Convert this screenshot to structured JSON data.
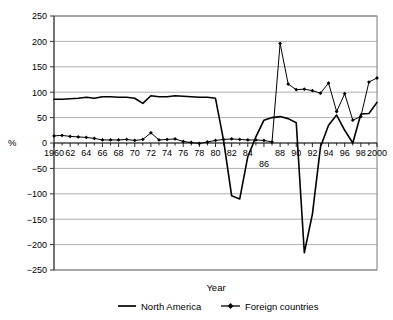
{
  "chart_data": {
    "type": "line",
    "title": "",
    "xlabel": "Year",
    "ylabel": "%",
    "ylim": [
      -250,
      250
    ],
    "ytick_step": 50,
    "yticks": [
      250,
      200,
      150,
      100,
      50,
      0,
      -50,
      -100,
      -150,
      -200,
      -250
    ],
    "ytick_labels": [
      "250",
      "200",
      "150",
      "100",
      "50",
      "0",
      "−50",
      "−100",
      "−150",
      "−200",
      "−250"
    ],
    "grid": true,
    "grid_axis": "y",
    "legend_position": "bottom",
    "x": [
      1960,
      1961,
      1962,
      1963,
      1964,
      1965,
      1966,
      1967,
      1968,
      1969,
      1970,
      1971,
      1972,
      1973,
      1974,
      1975,
      1976,
      1977,
      1978,
      1979,
      1980,
      1981,
      1982,
      1983,
      1984,
      1985,
      1986,
      1987,
      1988,
      1989,
      1990,
      1991,
      1992,
      1993,
      1994,
      1995,
      1996,
      1997,
      1998,
      1999,
      2000
    ],
    "xtick_labels": [
      "1960",
      "62",
      "64",
      "66",
      "68",
      "70",
      "72",
      "74",
      "76",
      "78",
      "80",
      "82",
      "84",
      "86",
      "88",
      "90",
      "92",
      "94",
      "96",
      "98",
      "2000"
    ],
    "xtick_values": [
      1960,
      1962,
      1964,
      1966,
      1968,
      1970,
      1972,
      1974,
      1976,
      1978,
      1980,
      1982,
      1984,
      1986,
      1988,
      1990,
      1992,
      1994,
      1996,
      1998,
      2000
    ],
    "series": [
      {
        "name": "North America",
        "marker": "none",
        "color": "#000000",
        "values": [
          86,
          86,
          87,
          88,
          90,
          88,
          91,
          91,
          90,
          90,
          88,
          78,
          93,
          91,
          91,
          93,
          92,
          91,
          90,
          90,
          88,
          0,
          -104,
          -110,
          -27,
          12,
          45,
          50,
          52,
          48,
          40,
          40,
          33,
          20,
          1,
          55,
          58,
          60,
          57,
          58,
          80
        ],
        "values_note": "approximate reading from plot"
      },
      {
        "name": "Foreign countries",
        "marker": "diamond",
        "color": "#000000",
        "values": [
          14,
          15,
          13,
          12,
          11,
          9,
          6,
          6,
          6,
          7,
          5,
          7,
          20,
          6,
          7,
          8,
          3,
          1,
          -1,
          2,
          5,
          7,
          8,
          7,
          6,
          6,
          5,
          2,
          196,
          116,
          105,
          106,
          103,
          98,
          118,
          62,
          97,
          45,
          52,
          120,
          128
        ],
        "values_note": "approximate reading from plot"
      }
    ],
    "na_points": [
      [
        1960,
        86
      ],
      [
        1961,
        86
      ],
      [
        1962,
        87
      ],
      [
        1963,
        88
      ],
      [
        1964,
        90
      ],
      [
        1965,
        88
      ],
      [
        1966,
        91
      ],
      [
        1967,
        91
      ],
      [
        1968,
        90
      ],
      [
        1969,
        90
      ],
      [
        1970,
        88
      ],
      [
        1971,
        78
      ],
      [
        1972,
        93
      ],
      [
        1973,
        91
      ],
      [
        1974,
        91
      ],
      [
        1975,
        93
      ],
      [
        1976,
        92
      ],
      [
        1977,
        91
      ],
      [
        1978,
        90
      ],
      [
        1979,
        90
      ],
      [
        1980,
        88
      ],
      [
        1981,
        5
      ],
      [
        1982,
        -104
      ],
      [
        1983,
        -110
      ],
      [
        1984,
        -27
      ],
      [
        1985,
        12
      ],
      [
        1986,
        45
      ],
      [
        1987,
        50
      ],
      [
        1988,
        52
      ],
      [
        1989,
        48
      ],
      [
        1990,
        40
      ],
      [
        1991,
        -216
      ],
      [
        1992,
        -140
      ],
      [
        1993,
        -8
      ],
      [
        1994,
        35
      ],
      [
        1995,
        55
      ],
      [
        1996,
        25
      ],
      [
        1997,
        0
      ],
      [
        1998,
        57
      ],
      [
        1999,
        58
      ],
      [
        2000,
        80
      ]
    ],
    "fc_points": [
      [
        1960,
        14
      ],
      [
        1961,
        15
      ],
      [
        1962,
        13
      ],
      [
        1963,
        12
      ],
      [
        1964,
        11
      ],
      [
        1965,
        9
      ],
      [
        1966,
        6
      ],
      [
        1967,
        6
      ],
      [
        1968,
        6
      ],
      [
        1969,
        7
      ],
      [
        1970,
        5
      ],
      [
        1971,
        7
      ],
      [
        1972,
        20
      ],
      [
        1973,
        6
      ],
      [
        1974,
        7
      ],
      [
        1975,
        8
      ],
      [
        1976,
        3
      ],
      [
        1977,
        1
      ],
      [
        1978,
        -1
      ],
      [
        1979,
        2
      ],
      [
        1980,
        5
      ],
      [
        1981,
        7
      ],
      [
        1982,
        8
      ],
      [
        1983,
        7
      ],
      [
        1984,
        6
      ],
      [
        1985,
        6
      ],
      [
        1986,
        5
      ],
      [
        1987,
        2
      ],
      [
        1988,
        196
      ],
      [
        1989,
        116
      ],
      [
        1990,
        105
      ],
      [
        1991,
        106
      ],
      [
        1992,
        103
      ],
      [
        1993,
        98
      ],
      [
        1994,
        118
      ],
      [
        1995,
        62
      ],
      [
        1996,
        97
      ],
      [
        1997,
        45
      ],
      [
        1998,
        52
      ],
      [
        1999,
        120
      ],
      [
        2000,
        128
      ]
    ]
  },
  "legend": {
    "items": [
      {
        "label": "North America",
        "marker": "line"
      },
      {
        "label": "Foreign countries",
        "marker": "line-diamond"
      }
    ]
  },
  "axis": {
    "x_title": "Year",
    "y_title": "%"
  }
}
